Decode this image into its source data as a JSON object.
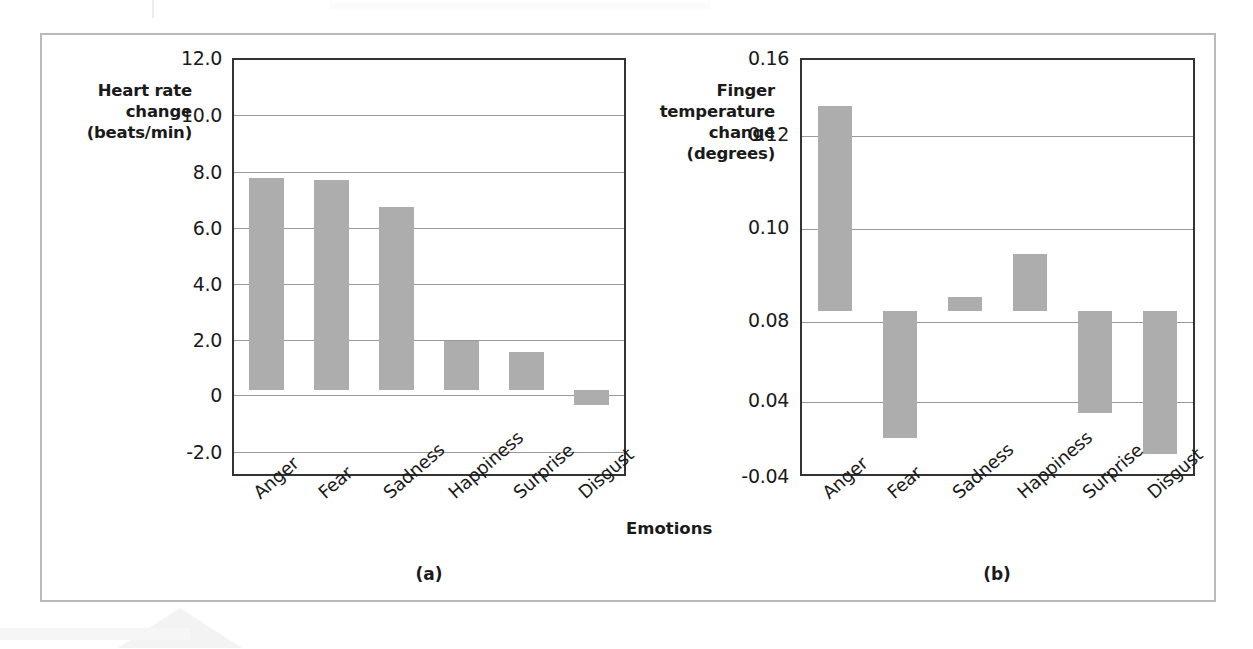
{
  "figure": {
    "panel_a_caption": "(a)",
    "panel_b_caption": "(b)",
    "x_axis_title": "Emotions"
  },
  "chart_data": [
    {
      "type": "bar",
      "panel": "(a)",
      "title": "",
      "xlabel": "Emotions",
      "ylabel": "Heart rate change (beats/min)",
      "ylabel_lines": [
        "Heart rate",
        "change",
        "(beats/min)"
      ],
      "categories": [
        "Anger",
        "Fear",
        "Sadness",
        "Happiness",
        "Surprise",
        "Disgust"
      ],
      "values": [
        7.7,
        7.65,
        6.65,
        1.8,
        1.4,
        -0.55
      ],
      "ylim": [
        -3.0,
        12.0
      ],
      "yticks": [
        12.0,
        10.0,
        8.0,
        6.0,
        4.0,
        2.0,
        0,
        -2.0
      ],
      "ytick_labels": [
        "12.0",
        "10.0",
        "8.0",
        "6.0",
        "4.0",
        "2.0",
        "0",
        "-2.0"
      ],
      "baseline": 0,
      "grid": true,
      "legend": "none",
      "bar_color": "#adadad"
    },
    {
      "type": "bar",
      "panel": "(b)",
      "title": "",
      "xlabel": "Emotions",
      "ylabel": "Finger temperature change (degrees)",
      "ylabel_lines": [
        "Finger",
        "temperature",
        "change",
        "(degrees)"
      ],
      "categories": [
        "Anger",
        "Fear",
        "Sadness",
        "Happiness",
        "Surprise",
        "Disgust"
      ],
      "values": [
        0.145,
        -0.025,
        0.047,
        0.069,
        -0.012,
        -0.033
      ],
      "ylim": [
        -0.04,
        0.16
      ],
      "yticks": [
        0.16,
        0.12,
        0.1,
        0.08,
        0.04,
        -0.04
      ],
      "ytick_labels": [
        "0.16",
        "0.12",
        "0.10",
        "0.08",
        "0.04",
        "-0.04"
      ],
      "baseline": 0.04,
      "grid": true,
      "legend": "none",
      "bar_color": "#adadad"
    }
  ],
  "colors": {
    "bar_fill": "#adadad",
    "plot_border": "#333333",
    "gridline": "#9a9a9a",
    "figure_border": "#b9b9b9",
    "text": "#1a1a1a"
  }
}
